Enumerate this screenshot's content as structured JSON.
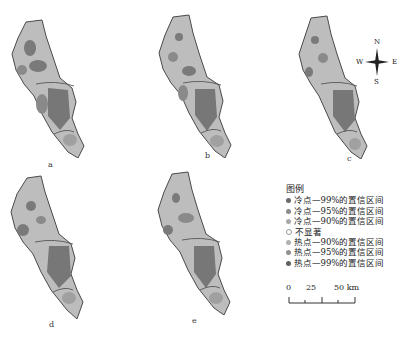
{
  "panels": [
    {
      "id": "a",
      "label": "a",
      "left": 8,
      "top": 18
    },
    {
      "id": "b",
      "label": "b",
      "left": 141,
      "top": 13
    },
    {
      "id": "c",
      "label": "c",
      "left": 297,
      "top": 14
    },
    {
      "id": "d",
      "label": "d",
      "left": 9,
      "top": 174
    },
    {
      "id": "e",
      "label": "e",
      "left": 152,
      "top": 170
    }
  ],
  "compass": {
    "n": "N",
    "s": "S",
    "e": "E",
    "w": "W"
  },
  "legend": {
    "title": "图例",
    "items": [
      {
        "label": "冷点—99%的置信区间",
        "color": "#6a6a6a"
      },
      {
        "label": "冷点—95%的置信区间",
        "color": "#8a8a8a"
      },
      {
        "label": "冷点—90%的置信区间",
        "color": "#a8a8a8"
      },
      {
        "label": "不显著",
        "color": "#ffffff"
      },
      {
        "label": "热点—90%的置信区间",
        "color": "#b0b0b0"
      },
      {
        "label": "热点—95%的置信区间",
        "color": "#909090"
      },
      {
        "label": "热点—99%的置信区间",
        "color": "#606060"
      }
    ]
  },
  "scale_bar": {
    "ticks": [
      "0",
      "25",
      "50 km"
    ]
  },
  "colors": {
    "light": "#c4c4c4",
    "mid": "#9a9a9a",
    "dark": "#6e6e6e",
    "outline": "#4a4a4a"
  }
}
